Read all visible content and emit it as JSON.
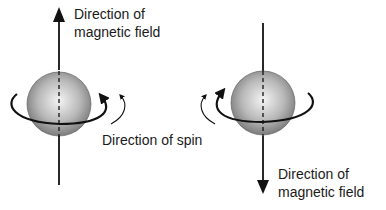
{
  "diagram": {
    "left_particle": {
      "field_label_line1": "Direction of",
      "field_label_line2": "magnetic field",
      "field_direction": "up"
    },
    "right_particle": {
      "field_label_line1": "Direction of",
      "field_label_line2": "magnetic field",
      "field_direction": "down"
    },
    "spin_label": "Direction of spin",
    "colors": {
      "sphere_light": "#f2f2f2",
      "sphere_dark": "#7a7a7a",
      "line": "#111111"
    }
  }
}
